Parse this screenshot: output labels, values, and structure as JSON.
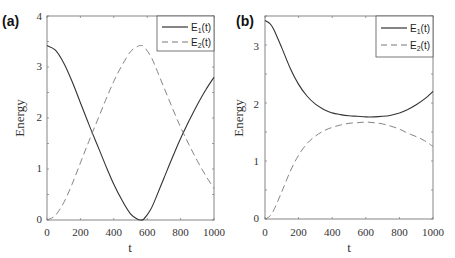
{
  "chart_data": [
    {
      "type": "line",
      "panel_label": "(a)",
      "xlabel": "t",
      "ylabel": "Energy",
      "xlim": [
        0,
        1000
      ],
      "ylim": [
        0,
        4
      ],
      "xticks": [
        0,
        200,
        400,
        600,
        800,
        1000
      ],
      "yticks": [
        0,
        1,
        2,
        3,
        4
      ],
      "grid": false,
      "legend_position": "upper right",
      "x": [
        0,
        50,
        100,
        150,
        200,
        250,
        300,
        350,
        400,
        450,
        500,
        540,
        560,
        580,
        620,
        650,
        700,
        750,
        800,
        850,
        900,
        950,
        1000
      ],
      "series": [
        {
          "name": "E1(t)",
          "style": "solid",
          "values": [
            3.42,
            3.33,
            3.08,
            2.72,
            2.3,
            1.88,
            1.48,
            1.08,
            0.7,
            0.38,
            0.12,
            0.02,
            0.0,
            0.02,
            0.2,
            0.42,
            0.82,
            1.22,
            1.6,
            1.94,
            2.26,
            2.55,
            2.8
          ]
        },
        {
          "name": "E2(t)",
          "style": "dashed",
          "values": [
            0.0,
            0.09,
            0.34,
            0.7,
            1.12,
            1.54,
            1.94,
            2.34,
            2.72,
            3.04,
            3.3,
            3.4,
            3.42,
            3.4,
            3.22,
            3.0,
            2.6,
            2.2,
            1.82,
            1.48,
            1.16,
            0.87,
            0.62
          ]
        }
      ]
    },
    {
      "type": "line",
      "panel_label": "(b)",
      "xlabel": "t",
      "ylabel": "Energy",
      "xlim": [
        0,
        1000
      ],
      "ylim": [
        0,
        3.5
      ],
      "xticks": [
        0,
        200,
        400,
        600,
        800,
        1000
      ],
      "yticks": [
        0,
        1,
        2,
        3
      ],
      "grid": false,
      "legend_position": "upper right",
      "x": [
        0,
        25,
        50,
        100,
        150,
        200,
        250,
        300,
        350,
        400,
        450,
        500,
        550,
        600,
        650,
        700,
        750,
        800,
        850,
        900,
        950,
        1000
      ],
      "series": [
        {
          "name": "E1(t)",
          "style": "solid",
          "values": [
            3.42,
            3.38,
            3.28,
            2.95,
            2.6,
            2.32,
            2.12,
            1.98,
            1.89,
            1.83,
            1.8,
            1.78,
            1.77,
            1.76,
            1.76,
            1.77,
            1.79,
            1.83,
            1.89,
            1.97,
            2.07,
            2.2
          ]
        },
        {
          "name": "E2(t)",
          "style": "dashed",
          "values": [
            0.0,
            0.04,
            0.14,
            0.47,
            0.82,
            1.1,
            1.3,
            1.43,
            1.52,
            1.58,
            1.62,
            1.65,
            1.66,
            1.67,
            1.66,
            1.64,
            1.6,
            1.55,
            1.48,
            1.42,
            1.35,
            1.25
          ]
        }
      ]
    }
  ],
  "panels": [
    {
      "label": "(a)",
      "xlabel": "t",
      "ylabel": "Energy",
      "legend": [
        "E",
        "E"
      ],
      "legend_sub": [
        "1",
        "2"
      ],
      "legend_arg": [
        "(t)",
        "(t)"
      ],
      "xticks": [
        "0",
        "200",
        "400",
        "600",
        "800",
        "1000"
      ],
      "yticks": [
        "0",
        "1",
        "2",
        "3",
        "4"
      ]
    },
    {
      "label": "(b)",
      "xlabel": "t",
      "ylabel": "Energy",
      "legend": [
        "E",
        "E"
      ],
      "legend_sub": [
        "1",
        "2"
      ],
      "legend_arg": [
        "(t)",
        "(t)"
      ],
      "xticks": [
        "0",
        "200",
        "400",
        "600",
        "800",
        "1000"
      ],
      "yticks": [
        "0",
        "1",
        "2",
        "3"
      ]
    }
  ],
  "colors": {
    "axis": "#555555",
    "e1": "#333333",
    "e2": "#777777"
  }
}
